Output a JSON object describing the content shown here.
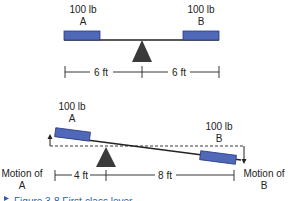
{
  "diagram": {
    "top": {
      "weight_a": "100 lb",
      "label_a": "A",
      "weight_b": "100 lb",
      "label_b": "B",
      "dist_left": "6 ft",
      "dist_right": "6 ft"
    },
    "bottom": {
      "weight_a": "100 lb",
      "label_a": "A",
      "weight_b": "100 lb",
      "label_b": "B",
      "dist_left": "4 ft",
      "dist_right": "8 ft",
      "motion_a_line1": "Motion of",
      "motion_a_line2": "A",
      "motion_b_line1": "Motion of",
      "motion_b_line2": "B"
    },
    "caption": "Figure 3-8   First-class lever"
  },
  "colors": {
    "weight_fill": "#5068b8",
    "fulcrum": "#3a3a3a",
    "line": "#222222",
    "caption": "#2b5fb0"
  }
}
